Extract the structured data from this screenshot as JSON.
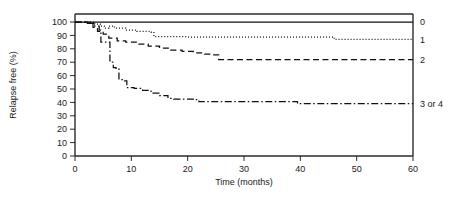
{
  "chart_data": {
    "type": "line",
    "title": "",
    "subtitle": "",
    "xlabel": "Time (months)",
    "ylabel": "Relapse free (%)",
    "xlim": [
      0,
      60
    ],
    "ylim": [
      0,
      100
    ],
    "xticks": [
      0,
      10,
      20,
      30,
      40,
      50,
      60
    ],
    "yticks": [
      0,
      10,
      20,
      30,
      40,
      50,
      60,
      70,
      80,
      90,
      100
    ],
    "xtick_labels": [
      "0",
      "10",
      "20",
      "30",
      "40",
      "50",
      "60"
    ],
    "ytick_labels": [
      "0",
      "10",
      "20",
      "30",
      "40",
      "50",
      "60",
      "70",
      "80",
      "90",
      "100"
    ],
    "grid": false,
    "legend_position": "right-of-axes-inline",
    "curve_style": "kaplan-meier-step",
    "series": [
      {
        "name": "0",
        "label": "0",
        "line_style": "solid",
        "color": "#111111",
        "label_y_value": 100,
        "x": [
          0,
          60
        ],
        "y": [
          100,
          100
        ],
        "points": [
          {
            "t": 0,
            "v": 100
          },
          {
            "t": 60,
            "v": 100
          }
        ]
      },
      {
        "name": "1",
        "label": "1",
        "line_style": "dotted",
        "color": "#111111",
        "label_y_value": 87,
        "x": [
          0,
          2.5,
          3.5,
          4.5,
          5.2,
          6,
          7,
          9,
          11,
          13.5,
          14,
          20,
          30,
          40,
          45.5,
          46,
          55,
          60
        ],
        "y": [
          100,
          100,
          98.5,
          97,
          95.5,
          97,
          95.5,
          94,
          93,
          92.5,
          89,
          88.8,
          88.8,
          88.8,
          88.8,
          87,
          87,
          87
        ],
        "points": [
          {
            "t": 0,
            "v": 100
          },
          {
            "t": 2.5,
            "v": 100
          },
          {
            "t": 3.5,
            "v": 98.5
          },
          {
            "t": 4.5,
            "v": 97
          },
          {
            "t": 5.2,
            "v": 95.5
          },
          {
            "t": 6.0,
            "v": 97
          },
          {
            "t": 7.0,
            "v": 95.5
          },
          {
            "t": 9.0,
            "v": 94
          },
          {
            "t": 11.0,
            "v": 93
          },
          {
            "t": 13.5,
            "v": 92.5
          },
          {
            "t": 14.0,
            "v": 89
          },
          {
            "t": 20.0,
            "v": 88.8
          },
          {
            "t": 30.0,
            "v": 88.8
          },
          {
            "t": 40.0,
            "v": 88.8
          },
          {
            "t": 45.5,
            "v": 88.8
          },
          {
            "t": 46.0,
            "v": 87
          },
          {
            "t": 60.0,
            "v": 87
          }
        ]
      },
      {
        "name": "2",
        "label": "2",
        "line_style": "dashed",
        "color": "#111111",
        "label_y_value": 72,
        "x": [
          0,
          2.2,
          3.2,
          4,
          5,
          6,
          7.5,
          9,
          11,
          13,
          15,
          17,
          19,
          21,
          23,
          24.5,
          25.5,
          35,
          45,
          55,
          60
        ],
        "y": [
          100,
          99,
          96,
          93,
          91,
          88,
          86,
          85,
          83.5,
          82,
          80.5,
          79,
          78,
          77,
          76,
          75.5,
          72,
          72,
          72,
          72,
          72
        ],
        "points": [
          {
            "t": 0,
            "v": 100
          },
          {
            "t": 2.2,
            "v": 99
          },
          {
            "t": 3.2,
            "v": 96
          },
          {
            "t": 4.0,
            "v": 93
          },
          {
            "t": 5.0,
            "v": 91
          },
          {
            "t": 6.0,
            "v": 88
          },
          {
            "t": 7.5,
            "v": 86
          },
          {
            "t": 9.0,
            "v": 85
          },
          {
            "t": 11.0,
            "v": 83.5
          },
          {
            "t": 13.0,
            "v": 82
          },
          {
            "t": 15.0,
            "v": 80.5
          },
          {
            "t": 17.0,
            "v": 79
          },
          {
            "t": 19.0,
            "v": 78
          },
          {
            "t": 21.0,
            "v": 77
          },
          {
            "t": 23.0,
            "v": 76
          },
          {
            "t": 24.5,
            "v": 75.5
          },
          {
            "t": 25.5,
            "v": 72
          },
          {
            "t": 35.0,
            "v": 72
          },
          {
            "t": 45.0,
            "v": 72
          },
          {
            "t": 55.0,
            "v": 72
          },
          {
            "t": 60.0,
            "v": 72
          }
        ]
      },
      {
        "name": "3 or 4",
        "label": "3 or 4",
        "line_style": "dash-dot",
        "color": "#111111",
        "label_y_value": 39,
        "x": [
          0,
          2.5,
          3.5,
          4.3,
          4.6,
          5.4,
          6.2,
          6.8,
          7.3,
          7.8,
          8.6,
          9.2,
          10.5,
          12,
          13.5,
          15,
          16.5,
          17.5,
          19,
          21,
          22,
          30,
          38.5,
          39.5,
          50,
          60
        ],
        "y": [
          100,
          99,
          97,
          94,
          85,
          85,
          70,
          66,
          65,
          57,
          56,
          51,
          50.5,
          49,
          47,
          45,
          43,
          42.5,
          42.5,
          42,
          40.5,
          40.5,
          40.5,
          39,
          39,
          39
        ],
        "points": [
          {
            "t": 0,
            "v": 100
          },
          {
            "t": 2.5,
            "v": 99
          },
          {
            "t": 3.5,
            "v": 97
          },
          {
            "t": 4.3,
            "v": 94
          },
          {
            "t": 4.6,
            "v": 85
          },
          {
            "t": 5.4,
            "v": 85
          },
          {
            "t": 6.2,
            "v": 70
          },
          {
            "t": 6.8,
            "v": 66
          },
          {
            "t": 7.3,
            "v": 65
          },
          {
            "t": 7.8,
            "v": 57
          },
          {
            "t": 8.6,
            "v": 56
          },
          {
            "t": 9.2,
            "v": 51
          },
          {
            "t": 10.5,
            "v": 50.5
          },
          {
            "t": 12.0,
            "v": 49
          },
          {
            "t": 13.5,
            "v": 47
          },
          {
            "t": 15.0,
            "v": 45
          },
          {
            "t": 16.5,
            "v": 43
          },
          {
            "t": 17.5,
            "v": 42.5
          },
          {
            "t": 19.0,
            "v": 42.5
          },
          {
            "t": 21.0,
            "v": 42
          },
          {
            "t": 22.0,
            "v": 40.5
          },
          {
            "t": 30.0,
            "v": 40.5
          },
          {
            "t": 38.5,
            "v": 40.5
          },
          {
            "t": 39.5,
            "v": 39
          },
          {
            "t": 50.0,
            "v": 39
          },
          {
            "t": 60.0,
            "v": 39
          }
        ]
      }
    ]
  }
}
